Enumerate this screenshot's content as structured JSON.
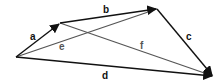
{
  "diagram": {
    "title": "",
    "colors": {
      "main": "#111111",
      "diagonal": "#555555",
      "background": "#ffffff"
    },
    "vertices": {
      "P": [
        16,
        57
      ],
      "Q": [
        60,
        23
      ],
      "R": [
        157,
        9
      ],
      "S": [
        213,
        76
      ]
    },
    "vectors": [
      {
        "label": "a",
        "from": "P",
        "to": "Q",
        "arrow": true,
        "label_pos": [
          33,
          39
        ]
      },
      {
        "label": "b",
        "from": "Q",
        "to": "R",
        "arrow": true,
        "label_pos": [
          105,
          12
        ]
      },
      {
        "label": "c",
        "from": "R",
        "to": "S",
        "arrow": true,
        "label_pos": [
          187,
          39
        ]
      },
      {
        "label": "d",
        "from": "P",
        "to": "S",
        "arrow": true,
        "label_pos": [
          104,
          77
        ]
      }
    ],
    "diagonals": [
      {
        "label": "e",
        "from": "P",
        "to": "R",
        "label_pos": [
          61,
          50
        ]
      },
      {
        "label": "f",
        "from": "Q",
        "to": "S",
        "label_pos": [
          141,
          48
        ]
      }
    ]
  }
}
